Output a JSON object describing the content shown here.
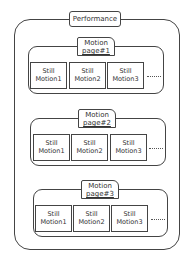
{
  "diagram": {
    "root": {
      "label": "Performance"
    },
    "pages": [
      {
        "title_line1": "Motion",
        "title_line2": "page#1",
        "items": [
          {
            "line1": "Still",
            "line2": "Motion1"
          },
          {
            "line1": "Still",
            "line2": "Motion2"
          },
          {
            "line1": "Still",
            "line2": "Motion3"
          }
        ],
        "ellipsis": "....."
      },
      {
        "title_line1": "Motion",
        "title_line2": "page#2",
        "items": [
          {
            "line1": "Still",
            "line2": "Motion1"
          },
          {
            "line1": "Still",
            "line2": "Motion2"
          },
          {
            "line1": "Still",
            "line2": "Motion3"
          }
        ],
        "ellipsis": "....."
      },
      {
        "title_line1": "Motion",
        "title_line2": "page#3",
        "items": [
          {
            "line1": "Still",
            "line2": "Motion1"
          },
          {
            "line1": "Still",
            "line2": "Motion2"
          },
          {
            "line1": "Still",
            "line2": "Motion3"
          }
        ],
        "ellipsis": "....."
      }
    ]
  }
}
